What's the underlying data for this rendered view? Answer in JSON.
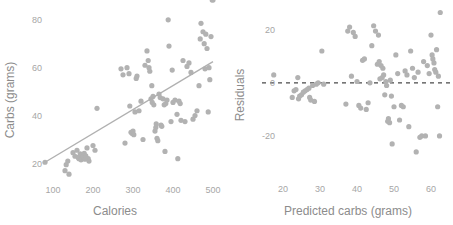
{
  "figure": {
    "background": "#ffffff",
    "point_color": "#b2b2b2",
    "fit_line_color": "#b0b0b0",
    "zero_line_color": "#4a4a4a",
    "tick_color": "#a6a6a6",
    "title_color": "#8c8c8c"
  },
  "chart_data": [
    {
      "type": "scatter",
      "panel": "left",
      "title": "",
      "xlabel": "Calories",
      "ylabel": "Carbs (grams)",
      "xlim": [
        60,
        520
      ],
      "ylim": [
        12,
        84
      ],
      "xticks": [
        100,
        200,
        300,
        400,
        500
      ],
      "xtick_labels": [
        "100",
        "200",
        "300",
        "400",
        "500"
      ],
      "yticks": [
        20,
        40,
        60,
        80
      ],
      "ytick_labels": [
        "20",
        "40",
        "60",
        "80"
      ],
      "grid": false,
      "legend": "none",
      "fit_line": {
        "label": "least-squares fit",
        "x": [
          80,
          500
        ],
        "y": [
          20.5,
          62.5
        ],
        "style": "solid"
      },
      "x": [
        80,
        130,
        133,
        137,
        140,
        150,
        155,
        160,
        163,
        165,
        168,
        170,
        172,
        175,
        178,
        180,
        182,
        185,
        188,
        190,
        200,
        205,
        210,
        270,
        275,
        280,
        285,
        290,
        292,
        295,
        298,
        300,
        302,
        305,
        308,
        310,
        315,
        320,
        325,
        330,
        335,
        338,
        340,
        342,
        345,
        347,
        348,
        350,
        352,
        355,
        357,
        358,
        360,
        362,
        365,
        368,
        370,
        372,
        375,
        378,
        380,
        382,
        385,
        388,
        390,
        395,
        398,
        400,
        405,
        410,
        412,
        415,
        418,
        420,
        425,
        430,
        435,
        440,
        445,
        450,
        455,
        460,
        465,
        468,
        470,
        475,
        478,
        480,
        482,
        485,
        488,
        490,
        492,
        495,
        498,
        500
      ],
      "y": [
        20.5,
        17.0,
        19.5,
        21.0,
        15.5,
        24.5,
        23.0,
        25.5,
        22.5,
        22.0,
        24.0,
        21.5,
        23.5,
        22.8,
        24.2,
        21.8,
        23.2,
        26.5,
        22.0,
        21.0,
        27.5,
        25.5,
        43.0,
        59.5,
        57.0,
        28.5,
        60.0,
        57.5,
        44.0,
        33.0,
        32.5,
        33.5,
        32.0,
        41.5,
        55.5,
        56.5,
        42.0,
        46.0,
        30.0,
        61.0,
        67.0,
        63.0,
        60.0,
        58.5,
        47.0,
        52.5,
        45.5,
        48.0,
        44.5,
        33.5,
        35.0,
        36.5,
        30.5,
        29.5,
        49.0,
        47.5,
        36.0,
        35.5,
        47.0,
        44.5,
        25.0,
        45.0,
        46.5,
        80.0,
        69.0,
        37.5,
        59.0,
        45.5,
        46.5,
        40.5,
        22.0,
        46.0,
        45.0,
        38.0,
        63.0,
        37.5,
        60.5,
        62.0,
        58.0,
        38.5,
        40.0,
        42.0,
        52.5,
        72.0,
        78.5,
        75.0,
        70.0,
        59.5,
        74.0,
        68.0,
        41.5,
        60.0,
        55.0,
        73.0
      ]
    },
    {
      "type": "scatter",
      "panel": "right",
      "title": "",
      "xlabel": "Predicted carbs (grams)",
      "ylabel": "Residuals",
      "xlim": [
        15,
        64
      ],
      "ylim": [
        -30,
        28
      ],
      "xticks": [
        20,
        30,
        40,
        50,
        60
      ],
      "xtick_labels": [
        "20",
        "30",
        "40",
        "50",
        "60"
      ],
      "yticks": [
        -20,
        0,
        20
      ],
      "ytick_labels": [
        "-20",
        "0",
        "20"
      ],
      "grid": false,
      "legend": "none",
      "zero_line": {
        "label": "residual = 0",
        "y": 0,
        "style": "dashed"
      },
      "x": [
        17.5,
        22.5,
        23.0,
        23.5,
        24.0,
        24.2,
        24.5,
        25.0,
        25.5,
        26.0,
        26.5,
        27.0,
        27.2,
        27.5,
        28.0,
        28.5,
        29.0,
        29.5,
        30.5,
        31.0,
        37.0,
        37.5,
        38.0,
        38.5,
        39.0,
        39.5,
        40.0,
        40.5,
        41.0,
        41.5,
        42.0,
        42.5,
        43.0,
        43.5,
        44.0,
        44.5,
        45.0,
        45.5,
        45.8,
        46.0,
        46.2,
        46.5,
        46.8,
        47.0,
        47.2,
        47.5,
        47.8,
        48.0,
        48.3,
        48.5,
        48.8,
        49.0,
        49.3,
        49.5,
        50.0,
        50.5,
        51.0,
        51.5,
        52.0,
        52.5,
        53.0,
        53.5,
        54.0,
        54.5,
        55.0,
        55.5,
        56.0,
        56.5,
        57.0,
        57.5,
        58.0,
        58.5,
        59.0,
        59.5,
        60.0,
        60.3,
        60.5,
        60.8,
        61.0,
        61.3,
        61.5,
        61.8,
        62.0,
        62.3,
        62.5
      ],
      "y": [
        3.0,
        -5.5,
        -3.0,
        -2.5,
        2.0,
        -6.0,
        -5.0,
        -4.5,
        -3.5,
        -3.0,
        -2.5,
        -2.0,
        -5.5,
        -6.5,
        -1.0,
        -7.0,
        -0.5,
        0.0,
        12.0,
        -0.5,
        -8.0,
        19.5,
        21.0,
        2.5,
        19.0,
        17.5,
        0.5,
        -8.5,
        -9.5,
        8.5,
        9.0,
        -10.0,
        -7.5,
        0.0,
        14.0,
        21.5,
        19.5,
        7.0,
        18.0,
        8.0,
        1.5,
        6.5,
        2.0,
        5.5,
        3.0,
        -4.5,
        0.5,
        -1.0,
        -14.5,
        -13.5,
        -15.0,
        1.0,
        -5.0,
        -23.0,
        -9.0,
        10.5,
        3.5,
        -14.0,
        -8.5,
        -9.0,
        4.5,
        3.0,
        -16.5,
        12.0,
        5.5,
        2.0,
        -26.0,
        4.0,
        -20.5,
        -20.0,
        8.0,
        -20.0,
        6.5,
        3.5,
        18.0,
        10.5,
        9.0,
        7.5,
        5.0,
        4.0,
        12.5,
        -9.0,
        2.5,
        -20.0,
        26.5
      ]
    }
  ]
}
